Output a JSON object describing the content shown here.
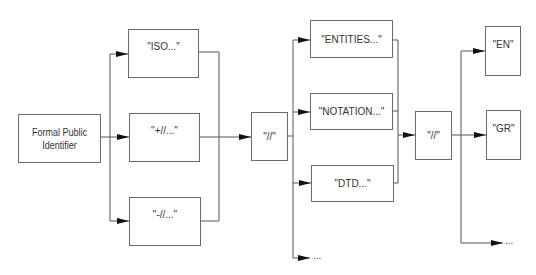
{
  "diagram": {
    "colors": {
      "line": "#555555",
      "border": "#6a6a6a",
      "text": "#333333",
      "background": "#ffffff"
    },
    "root": {
      "label_line1": "Formal Public",
      "label_line2": "Identifier"
    },
    "level1": [
      {
        "label": "\"ISO...\""
      },
      {
        "label": "\"+//...\""
      },
      {
        "label": "\"-//...\""
      }
    ],
    "separator1": {
      "label": "\"//\""
    },
    "level2": [
      {
        "label": "\"ENTITIES...\""
      },
      {
        "label": "\"NOTATION...\""
      },
      {
        "label": "\"DTD...\""
      },
      {
        "label": "..."
      }
    ],
    "separator2": {
      "label": "\"//\""
    },
    "level3": [
      {
        "label": "\"EN\""
      },
      {
        "label": "\"GR\""
      },
      {
        "label": "..."
      }
    ]
  }
}
